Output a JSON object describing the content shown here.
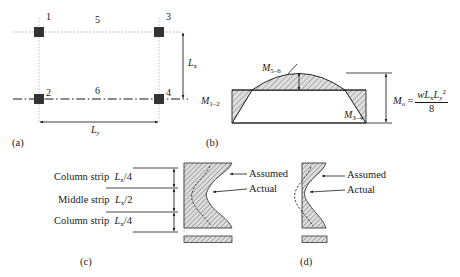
{
  "figure": {
    "colors": {
      "line": "#1a1a1a",
      "hatch": "#8a8a8a",
      "hatch_fill": "#d8d8d8",
      "dotted_guide": "#9a9a9a",
      "node_fill": "#333333"
    }
  },
  "panel_a": {
    "label": "(a)",
    "nodes": [
      {
        "id": "1",
        "label": "1"
      },
      {
        "id": "2",
        "label": "2"
      },
      {
        "id": "3",
        "label": "3"
      },
      {
        "id": "4",
        "label": "4"
      }
    ],
    "strip_numbers": [
      {
        "id": "5",
        "label": "5"
      },
      {
        "id": "6",
        "label": "6"
      }
    ],
    "dim_vertical": {
      "symbol": "L",
      "subscript": "x"
    },
    "dim_horizontal": {
      "symbol": "L",
      "subscript": "y"
    }
  },
  "panel_b": {
    "label": "(b)",
    "moments": [
      {
        "name": "M_1-2",
        "symbol": "M",
        "subscript": "1–2"
      },
      {
        "name": "M_5-6",
        "symbol": "M",
        "subscript": "5–6"
      },
      {
        "name": "M_3-4",
        "symbol": "M",
        "subscript": "3–4"
      }
    ],
    "total_moment": {
      "symbol": "M",
      "subscript": "o",
      "equals": "=",
      "numerator_w": "w",
      "numerator_L1": "L",
      "numerator_L1_sub": "x",
      "numerator_L2": "L",
      "numerator_L2_sub": "y",
      "numerator_L2_sup": "2",
      "denominator": "8"
    }
  },
  "panel_c": {
    "label": "(c)",
    "strips": [
      {
        "name": "Column strip",
        "dim_symbol": "L",
        "dim_sub": "x",
        "dim_frac": "/4"
      },
      {
        "name": "Middle strip",
        "dim_symbol": "L",
        "dim_sub": "x",
        "dim_frac": "/2"
      },
      {
        "name": "Column strip",
        "dim_symbol": "L",
        "dim_sub": "x",
        "dim_frac": "/4"
      }
    ],
    "annotations": [
      {
        "name": "assumed",
        "label": "Assumed"
      },
      {
        "name": "actual",
        "label": "Actual"
      }
    ]
  },
  "panel_d": {
    "label": "(d)",
    "annotations": [
      {
        "name": "assumed",
        "label": "Assumed"
      },
      {
        "name": "actual",
        "label": "Actual"
      }
    ]
  }
}
